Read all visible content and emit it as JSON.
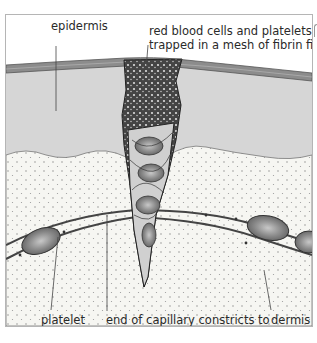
{
  "diagram": {
    "labels": {
      "epidermis": "epidermis",
      "clot_line1": "red blood cells and platelets",
      "clot_line2": "trapped in a mesh of fibrin fibres",
      "platelet": "platelet",
      "capillary_line1": "end of capillary constricts to",
      "capillary_line2": "slow down blood loss",
      "dermis": "dermis"
    },
    "colors": {
      "epidermis": "#8a8a8a",
      "upper_layer": "#d4d4d4",
      "dermis": "#f4f4f0",
      "capillary_wall": "#555555",
      "red_cell": "#9a9a9a",
      "clot": "#3a3a3a",
      "frame_border": "#b5b5b5"
    }
  }
}
